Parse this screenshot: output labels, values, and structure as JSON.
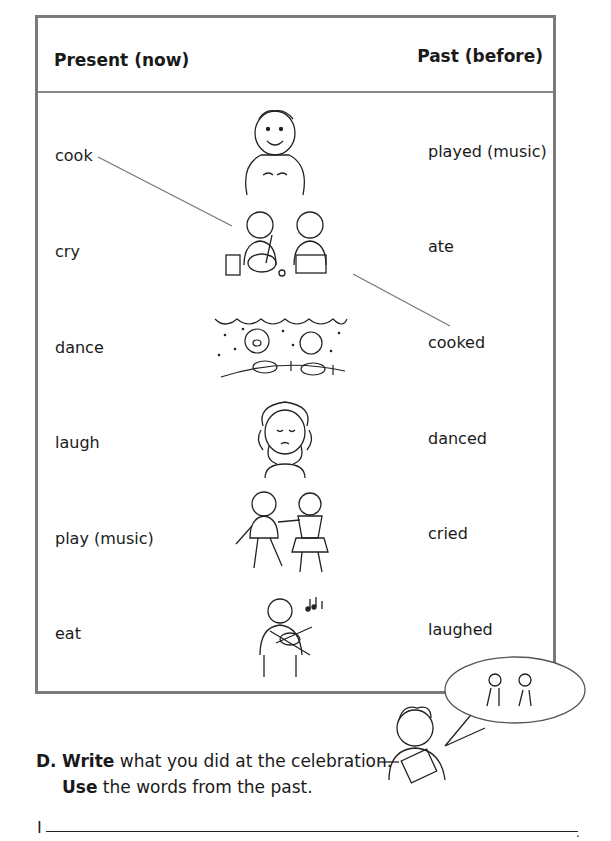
{
  "table": {
    "header_left": "Present (now)",
    "header_right": "Past (before)",
    "present_words": [
      "cook",
      "cry",
      "dance",
      "laugh",
      "play (music)",
      "eat"
    ],
    "past_words": [
      "played (music)",
      "ate",
      "cooked",
      "danced",
      "cried",
      "laughed"
    ],
    "pictures": [
      "eating-man-illustration",
      "cooking-couple-illustration",
      "party-dinner-illustration",
      "crying-girl-illustration",
      "dancing-couple-illustration",
      "violin-player-illustration"
    ]
  },
  "exercise": {
    "letter": "D.",
    "line1_bold": "Write",
    "line1_rest": " what you did at the celebration.",
    "line2_bold": "Use",
    "line2_rest": " the words from the past.",
    "answer_start": "I"
  }
}
